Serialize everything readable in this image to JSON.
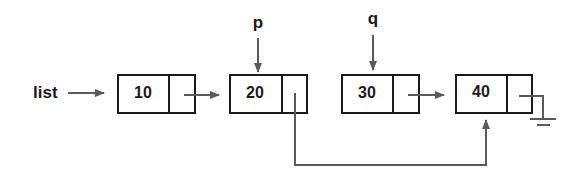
{
  "diagram": {
    "type": "linked-list",
    "head_label": "list",
    "nodes": [
      {
        "value": "10",
        "next": "20"
      },
      {
        "value": "20",
        "next": "40",
        "pointer": "p"
      },
      {
        "value": "30",
        "next": "40",
        "pointer": "q"
      },
      {
        "value": "40",
        "next": "null"
      }
    ],
    "pointers": [
      {
        "name": "p",
        "target": "20"
      },
      {
        "name": "q",
        "target": "30"
      }
    ],
    "colors": {
      "box_stroke": "#1a1a1a",
      "arrow": "#5a5a5a",
      "text": "#1a1a1a",
      "background": "#ffffff"
    }
  }
}
